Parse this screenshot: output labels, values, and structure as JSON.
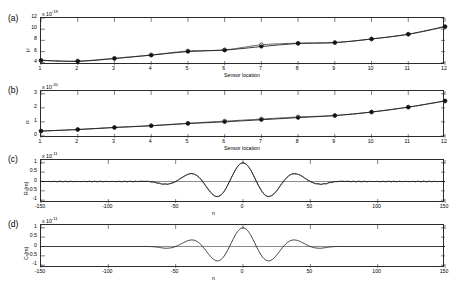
{
  "figure": {
    "background": "#ffffff",
    "line_color": "#1a1a1a",
    "marker_color": "#111111",
    "axis_color": "#2b2b2b"
  },
  "panels": [
    {
      "letter": "(a)",
      "ylabel": "μᵢ",
      "ylabel_plain": "mu_i",
      "xlabel": "Sensor location",
      "y_exponent_prefix": "x 10",
      "y_exponent": "-19",
      "yticks": [
        "12",
        "10",
        "8",
        "6",
        "4"
      ],
      "ytick_values": [
        12,
        10,
        8,
        6,
        4
      ],
      "ylim": [
        3.6,
        12
      ],
      "xticks": [
        "1",
        "2",
        "3",
        "4",
        "5",
        "6",
        "7",
        "8",
        "9",
        "10",
        "11",
        "12"
      ],
      "xlim": [
        1,
        12
      ],
      "grid": false
    },
    {
      "letter": "(b)",
      "ylabel": "σᵢ",
      "ylabel_plain": "sigma_i",
      "xlabel": "Sensor location",
      "y_exponent_prefix": "x 10",
      "y_exponent": "-20",
      "yticks": [
        "3",
        "2",
        "1",
        "0"
      ],
      "ytick_values": [
        3,
        2,
        1,
        0
      ],
      "ylim": [
        -0.15,
        3.2
      ],
      "xticks": [
        "1",
        "2",
        "3",
        "4",
        "5",
        "6",
        "7",
        "8",
        "9",
        "10",
        "11",
        "12"
      ],
      "xlim": [
        1,
        12
      ],
      "grid": false
    },
    {
      "letter": "(c)",
      "ylabel": "Rₓ(m)",
      "ylabel_plain": "R_x(m)",
      "xlabel": "n",
      "y_exponent_prefix": "x 10",
      "y_exponent": "-11",
      "yticks": [
        "1",
        "0.5",
        "0",
        "-0.5",
        "-1"
      ],
      "ytick_values": [
        1,
        0.5,
        0,
        -0.5,
        -1
      ],
      "ylim": [
        -1.15,
        1.15
      ],
      "xticks": [
        "-150",
        "-100",
        "-50",
        "0",
        "50",
        "100",
        "150"
      ],
      "xtick_values": [
        -150,
        -100,
        -50,
        0,
        50,
        100,
        150
      ],
      "xlim": [
        -150,
        150
      ],
      "grid": false
    },
    {
      "letter": "(d)",
      "ylabel": "Cₓ(m)",
      "ylabel_plain": "C_x(m)",
      "xlabel": "n",
      "y_exponent_prefix": "x 10",
      "y_exponent": "-11",
      "yticks": [
        "1",
        "0.5",
        "0",
        "-0.5",
        "-1"
      ],
      "ytick_values": [
        1,
        0.5,
        0,
        -0.5,
        -1
      ],
      "ylim": [
        -1.15,
        1.15
      ],
      "xticks": [
        "-150",
        "-100",
        "-50",
        "0",
        "50",
        "100",
        "150"
      ],
      "xtick_values": [
        -150,
        -100,
        -50,
        0,
        50,
        100,
        150
      ],
      "xlim": [
        -150,
        150
      ],
      "grid": false
    }
  ],
  "chart_data": [
    {
      "panel": "(a)",
      "type": "line",
      "title": "",
      "xlabel": "Sensor location",
      "ylabel": "mu_i",
      "y_scale": "1e-19",
      "xlim": [
        1,
        12
      ],
      "ylim": [
        3.6,
        12
      ],
      "grid": false,
      "legend": "none",
      "x": [
        1,
        2,
        3,
        4,
        5,
        6,
        7,
        8,
        9,
        10,
        11,
        12
      ],
      "series": [
        {
          "name": "estimated (solid, filled circles)",
          "style": "solid-line-filled-circle",
          "values": [
            4.45,
            4.25,
            4.75,
            5.35,
            6.0,
            6.25,
            6.9,
            7.45,
            7.6,
            8.25,
            9.1,
            10.5
          ]
        },
        {
          "name": "reference (dotted, open circles)",
          "style": "dotted-line-open-circle",
          "values": [
            4.4,
            4.3,
            4.8,
            5.4,
            6.1,
            6.3,
            7.2,
            7.5,
            7.6,
            8.25,
            9.1,
            10.4
          ]
        }
      ]
    },
    {
      "panel": "(b)",
      "type": "line",
      "title": "",
      "xlabel": "Sensor location",
      "ylabel": "sigma_i",
      "y_scale": "1e-20",
      "xlim": [
        1,
        12
      ],
      "ylim": [
        -0.15,
        3.2
      ],
      "grid": false,
      "legend": "none",
      "x": [
        1,
        2,
        3,
        4,
        5,
        6,
        7,
        8,
        9,
        10,
        11,
        12
      ],
      "series": [
        {
          "name": "estimated (solid, filled circles)",
          "style": "solid-line-filled-circle",
          "values": [
            0.35,
            0.45,
            0.6,
            0.72,
            0.88,
            1.0,
            1.15,
            1.3,
            1.45,
            1.7,
            2.05,
            2.5
          ]
        },
        {
          "name": "reference (dotted, open circles)",
          "style": "dotted-line-open-circle",
          "values": [
            0.34,
            0.46,
            0.6,
            0.73,
            0.9,
            1.05,
            1.2,
            1.35,
            1.45,
            1.7,
            2.05,
            2.48
          ]
        }
      ]
    },
    {
      "panel": "(c)",
      "type": "line",
      "title": "",
      "xlabel": "n",
      "ylabel": "R_x(m)",
      "y_scale": "1e-11",
      "xlim": [
        -150,
        150
      ],
      "ylim": [
        -1.15,
        1.15
      ],
      "grid": false,
      "legend": "none",
      "description": "Oscillatory autocorrelation: central peak at n=0 with value 1, negative lobes near n=-20 and n=+20, positive side lobes near n=-40 and n=+40, decaying to 0 beyond |n|>70",
      "series": [
        {
          "name": "autocorrelation",
          "style": "solid-line-with-dotted-overlay",
          "envelope_peaks": [
            {
              "n": 0,
              "value": 1.0
            },
            {
              "n": -20,
              "value": -0.55
            },
            {
              "n": 20,
              "value": -0.55
            },
            {
              "n": -40,
              "value": 0.35
            },
            {
              "n": 40,
              "value": 0.35
            },
            {
              "n": -60,
              "value": -0.07
            },
            {
              "n": 60,
              "value": -0.07
            },
            {
              "n": -100,
              "value": 0.0
            },
            {
              "n": 100,
              "value": 0.0
            },
            {
              "n": -150,
              "value": 0.0
            },
            {
              "n": 150,
              "value": 0.0
            }
          ]
        }
      ]
    },
    {
      "panel": "(d)",
      "type": "line",
      "title": "",
      "xlabel": "n",
      "ylabel": "C_x(m)",
      "y_scale": "1e-11",
      "xlim": [
        -150,
        150
      ],
      "ylim": [
        -1.15,
        1.15
      ],
      "grid": false,
      "legend": "none",
      "description": "Oscillatory covariance: central peak at n=0 with value 1, negative lobes near n=-20 and n=+20, positive side lobes near n=-40 and n=+40, flat zero beyond |n|>70",
      "series": [
        {
          "name": "covariance",
          "style": "solid-line",
          "envelope_peaks": [
            {
              "n": 0,
              "value": 1.0
            },
            {
              "n": -20,
              "value": -0.52
            },
            {
              "n": 20,
              "value": -0.52
            },
            {
              "n": -40,
              "value": 0.3
            },
            {
              "n": 40,
              "value": 0.3
            },
            {
              "n": -60,
              "value": -0.04
            },
            {
              "n": 60,
              "value": -0.04
            },
            {
              "n": -100,
              "value": 0.0
            },
            {
              "n": 100,
              "value": 0.0
            },
            {
              "n": -150,
              "value": 0.0
            },
            {
              "n": 150,
              "value": 0.0
            }
          ]
        }
      ]
    }
  ]
}
